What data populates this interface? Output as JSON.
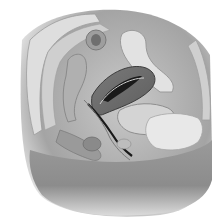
{
  "image": {
    "subject": "grayscale anatomical illustration, sagittal section of female pelvis",
    "width": 221,
    "height": 222,
    "colors": {
      "background": "#ffffff",
      "skin_dark": "#8a8a8a",
      "skin_mid": "#a8a8a8",
      "tissue_light": "#d8d8d8",
      "tissue_mid": "#bdbdbd",
      "organ_dark": "#6e6e6e",
      "cavity_black": "#1a1a1a",
      "bone_light": "#e6e6e6"
    }
  }
}
